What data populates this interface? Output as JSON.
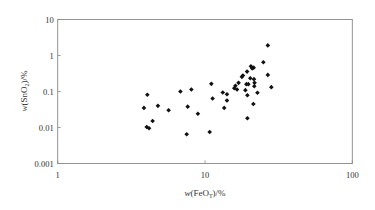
{
  "chart_data": {
    "type": "scatter",
    "title": "",
    "xlabel": "w(FeO_T)/%",
    "ylabel": "w(SnO_2)/%",
    "xscale": "log",
    "yscale": "log",
    "xlim": [
      1,
      100
    ],
    "ylim": [
      0.001,
      10
    ],
    "x_ticks": [
      "1",
      "10",
      "100"
    ],
    "y_ticks": [
      "10",
      "1",
      "0.1",
      "0.01",
      "0.001"
    ],
    "grid": false,
    "legend": null,
    "marker": "diamond",
    "marker_color": "#111111",
    "points": [
      [
        3.85,
        0.035
      ],
      [
        4.06,
        0.081
      ],
      [
        4.02,
        0.0103
      ],
      [
        4.17,
        0.0095
      ],
      [
        4.41,
        0.0151
      ],
      [
        4.79,
        0.04
      ],
      [
        5.66,
        0.03
      ],
      [
        6.81,
        0.1
      ],
      [
        7.63,
        0.038
      ],
      [
        8.08,
        0.114
      ],
      [
        7.51,
        0.0065
      ],
      [
        8.95,
        0.024
      ],
      [
        10.76,
        0.0075
      ],
      [
        11.04,
        0.163
      ],
      [
        11.26,
        0.064
      ],
      [
        13.2,
        0.094
      ],
      [
        13.5,
        0.035
      ],
      [
        14.1,
        0.084
      ],
      [
        14.1,
        0.056
      ],
      [
        15.8,
        0.124
      ],
      [
        16.1,
        0.144
      ],
      [
        16.5,
        0.114
      ],
      [
        16.9,
        0.174
      ],
      [
        17.8,
        0.255
      ],
      [
        18.1,
        0.277
      ],
      [
        18.8,
        0.109
      ],
      [
        19.1,
        0.16
      ],
      [
        19.4,
        0.079
      ],
      [
        19.4,
        0.018
      ],
      [
        19.7,
        0.16
      ],
      [
        19.3,
        0.357
      ],
      [
        20.3,
        0.234
      ],
      [
        20.5,
        0.5
      ],
      [
        20.9,
        0.44
      ],
      [
        21.4,
        0.46
      ],
      [
        21.3,
        0.045
      ],
      [
        21.5,
        0.22
      ],
      [
        21.6,
        0.14
      ],
      [
        21.7,
        0.174
      ],
      [
        22.7,
        0.092
      ],
      [
        24.9,
        0.647
      ],
      [
        26.7,
        1.91
      ],
      [
        26.7,
        0.289
      ],
      [
        28.2,
        0.132
      ]
    ]
  },
  "axes": {
    "x_label_prefix": "w",
    "x_label_body": "(FeO",
    "x_label_sub": "T",
    "x_label_suffix": ")/%",
    "y_label_prefix": "w",
    "y_label_body": "(SnO",
    "y_label_sub": "2",
    "y_label_suffix": ")/%"
  }
}
